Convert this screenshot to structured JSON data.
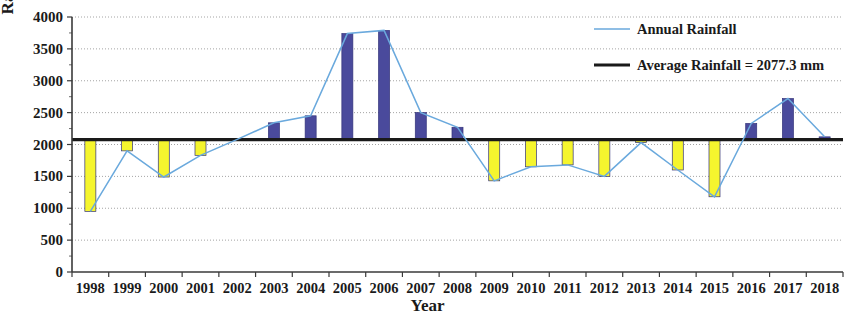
{
  "chart_data": {
    "type": "bar",
    "title": "",
    "xlabel": "Year",
    "ylabel": "Rainfall (mm)",
    "ylim": [
      0,
      4000
    ],
    "ytick_step": 500,
    "yticks": [
      0,
      500,
      1000,
      1500,
      2000,
      2500,
      3000,
      3500,
      4000
    ],
    "grid": true,
    "legend_position": "top-right",
    "categories": [
      "1998",
      "1999",
      "2000",
      "2001",
      "2002",
      "2003",
      "2004",
      "2005",
      "2006",
      "2007",
      "2008",
      "2009",
      "2010",
      "2011",
      "2012",
      "2013",
      "2014",
      "2015",
      "2016",
      "2017",
      "2018"
    ],
    "series": [
      {
        "name": "Annual Rainfall",
        "type": "line+bar",
        "color": "#6aa9dd",
        "bar_color_above": "#4a4a9c",
        "bar_color_below": "#f5f52e",
        "values": [
          950,
          1900,
          1490,
          1830,
          2080,
          2340,
          2450,
          3740,
          3790,
          2500,
          2270,
          1430,
          1650,
          1680,
          1500,
          2030,
          1600,
          1180,
          2330,
          2720,
          2120
        ]
      },
      {
        "name": "Average Rainfall = 2077.3 mm",
        "type": "reference-line",
        "color": "#1a1a1a",
        "value": 2077.3
      }
    ],
    "legend": [
      {
        "label": "Annual Rainfall",
        "color": "#6aa9dd",
        "style": "line-thin"
      },
      {
        "label": "Average Rainfall = 2077.3 mm",
        "color": "#1a1a1a",
        "style": "line-thick"
      }
    ]
  },
  "axis": {
    "y_title": "Rainfall (mm)",
    "x_title": "Year"
  }
}
